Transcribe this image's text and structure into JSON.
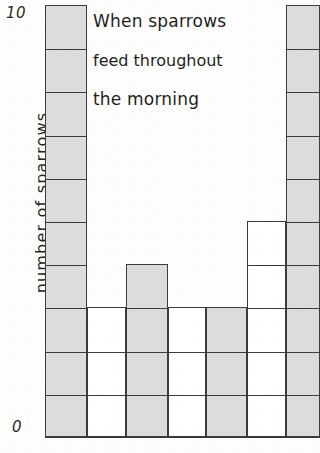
{
  "chart_data": {
    "type": "bar",
    "title": "When sparrows feed throughout the morning",
    "title_lines": [
      "When sparrows",
      "feed throughout",
      "the morning"
    ],
    "xlabel": "",
    "ylabel": "number of sparrows",
    "ylim": [
      0,
      10
    ],
    "y_ticks": [
      "0",
      "10"
    ],
    "y_tick_top": "10",
    "y_tick_bottom": "0",
    "grid": "unit squares drawn inside each bar",
    "legend": "none",
    "categories": [
      "1",
      "2",
      "3",
      "4",
      "5",
      "6",
      "7"
    ],
    "values": [
      10,
      3,
      4,
      3,
      3,
      5,
      10
    ],
    "bar_styles": [
      "shaded",
      "unshaded",
      "shaded",
      "unshaded",
      "shaded",
      "unshaded",
      "shaded"
    ],
    "colors": {
      "shaded_fill": "#dcdcdc",
      "unshaded_fill": "#ffffff",
      "outline": "#3c3c3c",
      "paper": "#fdfdfc",
      "ink": "#1f1f1f"
    },
    "bars": [
      {
        "index": 1,
        "value": 10,
        "style": "shaded",
        "x": 0,
        "width": 42
      },
      {
        "index": 2,
        "value": 3,
        "style": "unshaded",
        "x": 42,
        "width": 39
      },
      {
        "index": 3,
        "value": 4,
        "style": "shaded",
        "x": 81,
        "width": 42
      },
      {
        "index": 4,
        "value": 3,
        "style": "unshaded",
        "x": 123,
        "width": 38
      },
      {
        "index": 5,
        "value": 3,
        "style": "shaded",
        "x": 161,
        "width": 41
      },
      {
        "index": 6,
        "value": 5,
        "style": "unshaded",
        "x": 202,
        "width": 39
      },
      {
        "index": 7,
        "value": 10,
        "style": "shaded",
        "x": 241,
        "width": 34
      }
    ]
  }
}
